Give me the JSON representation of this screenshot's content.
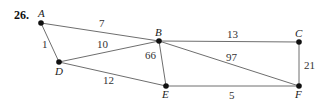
{
  "problem_number": "26.",
  "nodes": [
    {
      "id": "A",
      "label": "A",
      "x": 41,
      "y": 23,
      "lx": 38,
      "ly": 17
    },
    {
      "id": "B",
      "label": "B",
      "x": 159,
      "y": 41,
      "lx": 155,
      "ly": 36
    },
    {
      "id": "C",
      "label": "C",
      "x": 299,
      "y": 42,
      "lx": 295,
      "ly": 37
    },
    {
      "id": "D",
      "label": "D",
      "x": 59,
      "y": 62,
      "lx": 55,
      "ly": 75
    },
    {
      "id": "E",
      "label": "E",
      "x": 166,
      "y": 86,
      "lx": 162,
      "ly": 98
    },
    {
      "id": "F",
      "label": "F",
      "x": 299,
      "y": 86,
      "lx": 295,
      "ly": 98
    }
  ],
  "edges": [
    {
      "from": "A",
      "to": "B",
      "weight": "7",
      "wx": 99,
      "wy": 27
    },
    {
      "from": "A",
      "to": "D",
      "weight": "1",
      "wx": 42,
      "wy": 48
    },
    {
      "from": "D",
      "to": "B",
      "weight": "10",
      "wx": 97,
      "wy": 48
    },
    {
      "from": "D",
      "to": "E",
      "weight": "12",
      "wx": 103,
      "wy": 84
    },
    {
      "from": "B",
      "to": "E",
      "weight": "66",
      "wx": 145,
      "wy": 59
    },
    {
      "from": "B",
      "to": "C",
      "weight": "13",
      "wx": 227,
      "wy": 38
    },
    {
      "from": "B",
      "to": "F",
      "weight": "97",
      "wx": 226,
      "wy": 61
    },
    {
      "from": "C",
      "to": "F",
      "weight": "21",
      "wx": 304,
      "wy": 69
    },
    {
      "from": "E",
      "to": "F",
      "weight": "5",
      "wx": 229,
      "wy": 99
    }
  ]
}
